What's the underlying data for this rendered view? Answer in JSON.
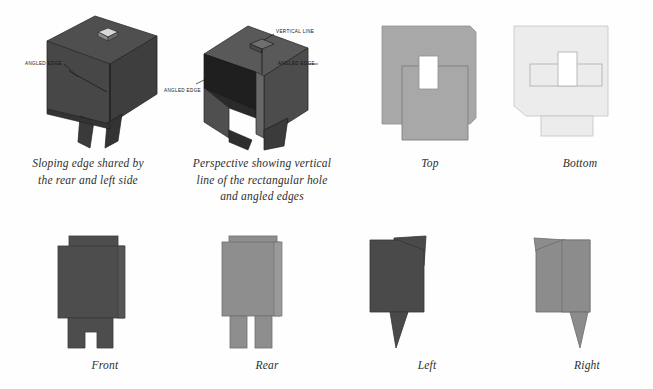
{
  "page": {
    "background": "#fefefe",
    "kind": "technical-orthographic-projection-plate"
  },
  "palette": {
    "dark_face": "#4a4a4a",
    "darker_face": "#3f3f3f",
    "mid_face": "#5a5a5a",
    "shadow_face": "#2b2b2b",
    "light_gray": "#a8a8a8",
    "pale_gray": "#ebebeb",
    "outline": "#6d6d6d",
    "hole_white": "#ffffff",
    "label_text": "#141414",
    "caption_text": "#2e2e2e"
  },
  "figures": [
    {
      "id": "perspective-1",
      "caption": "Sloping edge shared by\nthe rear and left side",
      "labels": [
        {
          "text": "ANGLED EDGE",
          "name": "angled-edge-label"
        }
      ]
    },
    {
      "id": "perspective-2",
      "caption": "Perspective showing vertical\nline of the rectangular hole\nand angled edges",
      "labels": [
        {
          "text": "VERTICAL LINE",
          "name": "vertical-line-label"
        },
        {
          "text": "ANGLED EDGE",
          "name": "angled-edge-right-label"
        },
        {
          "text": "ANGLED EDGE",
          "name": "angled-edge-left-label"
        }
      ]
    },
    {
      "id": "top-view",
      "caption": "Top"
    },
    {
      "id": "bottom-view",
      "caption": "Bottom"
    },
    {
      "id": "front-view",
      "caption": "Front"
    },
    {
      "id": "rear-view",
      "caption": "Rear"
    },
    {
      "id": "left-view",
      "caption": "Left"
    },
    {
      "id": "right-view",
      "caption": "Right"
    }
  ]
}
